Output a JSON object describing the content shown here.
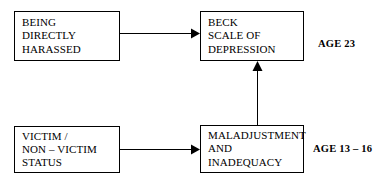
{
  "diagram": {
    "background_color": "#ffffff",
    "stroke_color": "#000000",
    "nodes": [
      {
        "id": "being-directly-harassed",
        "lines": [
          "BEING",
          "DIRECTLY",
          "HARASSED"
        ]
      },
      {
        "id": "beck-scale-of-depression",
        "lines": [
          "BECK",
          "SCALE OF",
          "DEPRESSION"
        ]
      },
      {
        "id": "victim-non-victim-status",
        "lines": [
          "VICTIM /",
          "NON – VICTIM",
          "STATUS"
        ]
      },
      {
        "id": "maladjustment-and-inadequacy",
        "lines": [
          "MALADJUSTMENT",
          "AND",
          "INADEQUACY"
        ]
      }
    ],
    "age_labels": [
      {
        "id": "age-23",
        "text": "AGE 23"
      },
      {
        "id": "age-13-16",
        "text": "AGE 13 – 16"
      }
    ],
    "arrows": [
      {
        "id": "harassed-to-beck",
        "from": "being-directly-harassed",
        "to": "beck-scale-of-depression",
        "direction": "right"
      },
      {
        "id": "victim-to-maladjustment",
        "from": "victim-non-victim-status",
        "to": "maladjustment-and-inadequacy",
        "direction": "right"
      },
      {
        "id": "maladjustment-to-beck",
        "from": "maladjustment-and-inadequacy",
        "to": "beck-scale-of-depression",
        "direction": "up"
      }
    ]
  }
}
